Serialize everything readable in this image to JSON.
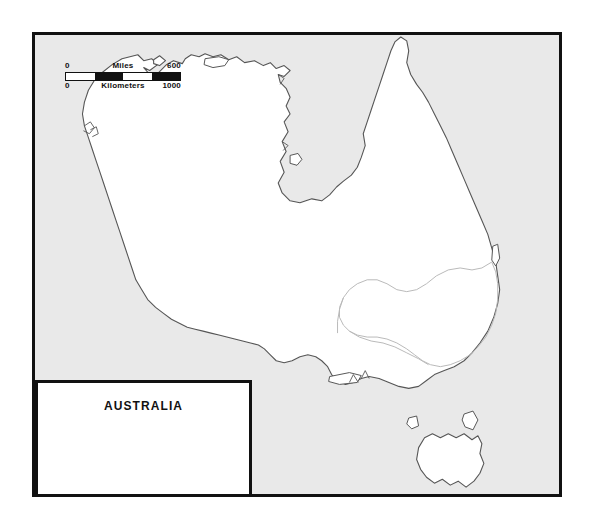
{
  "map": {
    "region_name": "Australia",
    "frame": {
      "x": 32,
      "y": 32,
      "width": 530,
      "height": 465
    },
    "colors": {
      "ocean": "#e9e9e9",
      "land": "#ffffff",
      "coastline": "#555555",
      "border": "#111111",
      "internal_boundary": "#b9b9b9",
      "page_background": "#ffffff"
    }
  },
  "scale_bar": {
    "miles_label": "Miles",
    "miles_min": "0",
    "miles_max": "600",
    "kilometers_label": "Kilometers",
    "kilometers_min": "0",
    "kilometers_max": "1000",
    "segments": 4
  },
  "legend": {
    "title": "AUSTRALIA"
  },
  "features": {
    "landmass_label": "Australian mainland",
    "island_labels": [
      "Tasmania",
      "Kangaroo Island",
      "Melville Island",
      "Groote Eylandt",
      "Fraser Island",
      "King Island",
      "Flinders Island"
    ]
  }
}
